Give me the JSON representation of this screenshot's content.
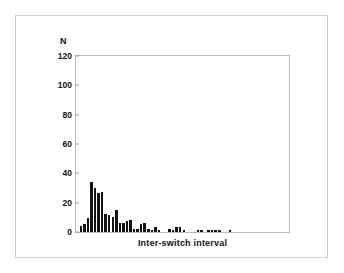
{
  "figure": {
    "background_color": "#ffffff",
    "frame_color": "#cfcfcf",
    "axes_color": "#bdbdbd",
    "bar_color": "#121212"
  },
  "chart_data": {
    "type": "bar",
    "title": "",
    "subtitle": "",
    "xlabel": "Inter-switch interval",
    "ylabel": "N",
    "ylim": [
      0,
      120
    ],
    "xlim": [
      0,
      60
    ],
    "y_ticks": [
      0,
      20,
      40,
      60,
      80,
      100,
      120
    ],
    "y_tick_labels": [
      "0",
      "20",
      "40",
      "60",
      "80",
      "100",
      "120"
    ],
    "x_ticks": [],
    "x_tick_labels": [],
    "grid": false,
    "legend": false,
    "legend_position": "none",
    "bin_count": 60,
    "categories": [
      "1",
      "2",
      "3",
      "4",
      "5",
      "6",
      "7",
      "8",
      "9",
      "10",
      "11",
      "12",
      "13",
      "14",
      "15",
      "16",
      "17",
      "18",
      "19",
      "20",
      "21",
      "22",
      "23",
      "24",
      "25",
      "26",
      "27",
      "28",
      "29",
      "30",
      "31",
      "32",
      "33",
      "34",
      "35",
      "36",
      "37",
      "38",
      "39",
      "40",
      "41",
      "42",
      "43",
      "44",
      "45",
      "46",
      "47",
      "48",
      "49",
      "50",
      "51",
      "52",
      "53",
      "54",
      "55",
      "56",
      "57",
      "58",
      "59",
      "60"
    ],
    "values": [
      1,
      5,
      6,
      10,
      35,
      31,
      27,
      28,
      13,
      12,
      11,
      16,
      7,
      7,
      8,
      9,
      3,
      3,
      6,
      7,
      3,
      2,
      4,
      2,
      1,
      1,
      3,
      2,
      4,
      4,
      2,
      1,
      1,
      0,
      2,
      2,
      0,
      2,
      2,
      2,
      2,
      0,
      1,
      2,
      0,
      0,
      1,
      0,
      0,
      1,
      0,
      0,
      0,
      0,
      0,
      0,
      0,
      0,
      0,
      0
    ]
  }
}
